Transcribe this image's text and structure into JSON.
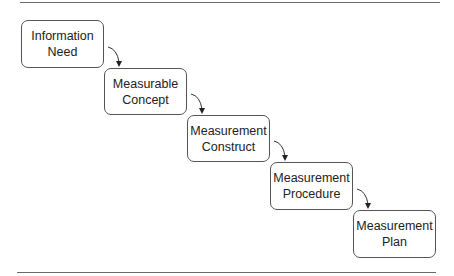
{
  "diagram": {
    "type": "staircase-flow",
    "steps": [
      {
        "id": "information-need",
        "line1": "Information",
        "line2": "Need"
      },
      {
        "id": "measurable-concept",
        "line1": "Measurable",
        "line2": "Concept"
      },
      {
        "id": "measurement-construct",
        "line1": "Measurement",
        "line2": "Construct"
      },
      {
        "id": "measurement-procedure",
        "line1": "Measurement",
        "line2": "Procedure"
      },
      {
        "id": "measurement-plan",
        "line1": "Measurement",
        "line2": "Plan"
      }
    ],
    "connectors": [
      {
        "from": "information-need",
        "to": "measurable-concept"
      },
      {
        "from": "measurable-concept",
        "to": "measurement-construct"
      },
      {
        "from": "measurement-construct",
        "to": "measurement-procedure"
      },
      {
        "from": "measurement-procedure",
        "to": "measurement-plan"
      }
    ],
    "colors": {
      "stroke": "#555555",
      "rule": "#6a6a6a",
      "text": "#222222",
      "background": "#ffffff"
    }
  }
}
